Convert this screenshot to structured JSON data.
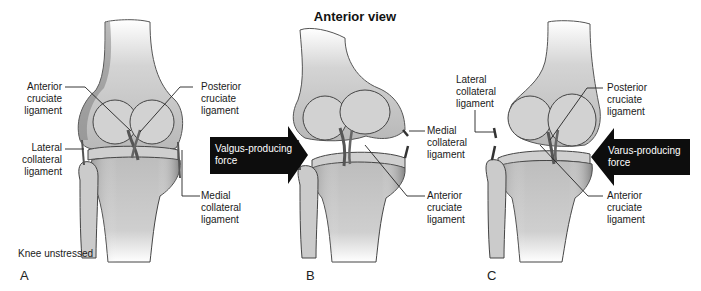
{
  "title": "Anterior view",
  "panels": [
    {
      "letter": "A",
      "caption": "Knee unstressed",
      "labels": {
        "acl": "Anterior\ncruciate\nligament",
        "pcl": "Posterior\ncruciate\nligament",
        "lcl": "Lateral\ncollateral\nligament",
        "mcl": "Medial\ncollateral\nligament"
      }
    },
    {
      "letter": "B",
      "force": "Valgus-producing\nforce",
      "labels": {
        "mcl": "Medial\ncollateral\nligament",
        "acl": "Anterior\ncruciate\nligament"
      }
    },
    {
      "letter": "C",
      "force": "Varus-producing\nforce",
      "labels": {
        "lcl": "Lateral\ncollateral\nligament",
        "pcl": "Posterior\ncruciate\nligament",
        "acl": "Anterior\ncruciate\nligament"
      }
    }
  ],
  "colors": {
    "bone_fill": "#d9d9d9",
    "bone_shade": "#8a8a8a",
    "outline": "#3a3a3a",
    "arrow": "#0d0d0d",
    "leader": "#222222"
  }
}
